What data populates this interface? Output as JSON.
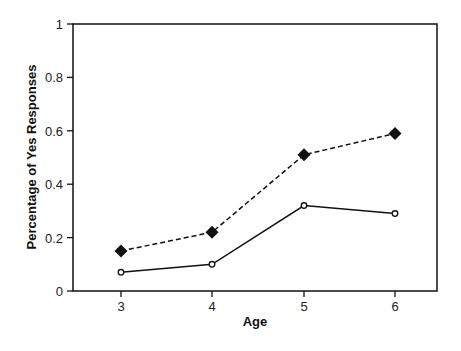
{
  "chart_data": {
    "type": "line",
    "title": "",
    "xlabel": "Age",
    "ylabel": "Percentage of Yes Responses",
    "x": [
      3,
      4,
      5,
      6
    ],
    "categories": [
      "3",
      "4",
      "5",
      "6"
    ],
    "ylim": [
      0,
      1
    ],
    "yticks": [
      "0",
      "0.2",
      "0.4",
      "0.6",
      "0.8",
      "1"
    ],
    "grid": false,
    "legend": null,
    "series": [
      {
        "name": "Series A (dashed, filled diamonds)",
        "values": [
          0.15,
          0.22,
          0.51,
          0.59
        ],
        "line_style": "dashed",
        "marker": "filled-diamond",
        "color": "#111111"
      },
      {
        "name": "Series B (solid, open circles)",
        "values": [
          0.07,
          0.1,
          0.32,
          0.29
        ],
        "line_style": "solid",
        "marker": "open-circle",
        "color": "#111111"
      }
    ]
  }
}
